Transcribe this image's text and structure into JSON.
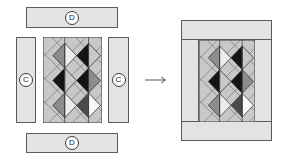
{
  "diagram": {
    "pieces": {
      "top_border": {
        "label": "D"
      },
      "left_side": {
        "label": "C"
      },
      "right_side": {
        "label": "C"
      },
      "bottom_border": {
        "label": "D"
      }
    },
    "arrow": "→",
    "colors": {
      "border_fill": "#e3e3e3",
      "outline": "#5a5a5a",
      "black": "#141414",
      "dark_gray": "#4a4a4a",
      "mid_gray": "#8c8c8c",
      "light_gray": "#c8c8c8",
      "very_light": "#ececec",
      "white": "#f8f8f8"
    }
  }
}
